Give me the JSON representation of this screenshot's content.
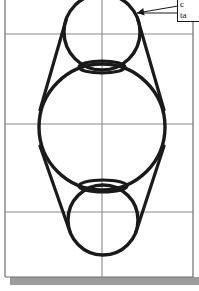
{
  "figure": {
    "background_color": "#ffffff",
    "ink_color": "#1a1a1a",
    "grid_color": "#8a8a8a",
    "shadow_color": "#9a9a9a",
    "canvas": {
      "width": 199,
      "height": 291
    },
    "border": {
      "name": "figure-frame",
      "left_x": 5,
      "right_x": 193,
      "top_y": -2,
      "bottom_y": 277,
      "color": "#6e6e6e",
      "stroke_width": 1.2
    },
    "grid": {
      "horizontal_lines_y": [
        34,
        124,
        212
      ],
      "vertical_lines_x": [
        102
      ],
      "color": "#8a8a8a",
      "stroke_width": 1.1,
      "visible": true
    },
    "shadow_bar": {
      "name": "drop-shadow-bar",
      "x": 10,
      "y": 277,
      "width": 189,
      "height": 8,
      "color": "#9c9c9c"
    },
    "circles": [
      {
        "name": "top-circle",
        "cx": 102,
        "cy": 32,
        "r": 38,
        "stroke_width": 3.4
      },
      {
        "name": "middle-circle",
        "cx": 102,
        "cy": 127,
        "r": 63,
        "stroke_width": 3.4
      },
      {
        "name": "bottom-circle",
        "cx": 103,
        "cy": 220,
        "r": 35,
        "stroke_width": 3.4
      }
    ],
    "ellipses": [
      {
        "name": "upper-ellipse",
        "cx": 102,
        "cy": 67,
        "rx": 23,
        "ry": 6,
        "stroke_width": 3.2
      },
      {
        "name": "lower-ellipse",
        "cx": 103,
        "cy": 186,
        "rx": 24,
        "ry": 6,
        "stroke_width": 3.2
      }
    ],
    "tangent_lines": [
      {
        "name": "tangent-upper-left",
        "x1": 66,
        "y1": 20,
        "x2": 40,
        "y2": 110,
        "stroke_width": 3.2
      },
      {
        "name": "tangent-upper-right",
        "x1": 138,
        "y1": 20,
        "x2": 164,
        "y2": 110,
        "stroke_width": 3.2
      },
      {
        "name": "tangent-lower-left",
        "x1": 40,
        "y1": 146,
        "x2": 70,
        "y2": 232,
        "stroke_width": 3.2
      },
      {
        "name": "tangent-lower-right",
        "x1": 164,
        "y1": 146,
        "x2": 136,
        "y2": 232,
        "stroke_width": 3.2
      }
    ],
    "leader": {
      "name": "callout-leader-arrow",
      "from_x": 178,
      "from_y": 6,
      "to_x": 137,
      "to_y": 13,
      "second_from_x": 178,
      "second_from_y": 13,
      "arrow_head_size": 7,
      "stroke_width": 1.0
    },
    "callout": {
      "name": "annotation-callout",
      "line1": "c",
      "line2": "ta",
      "clipped": true
    }
  }
}
